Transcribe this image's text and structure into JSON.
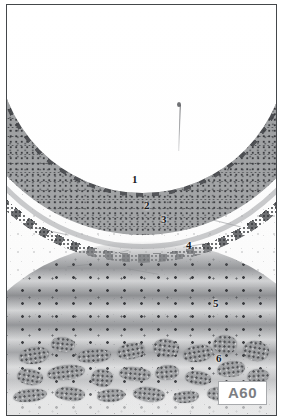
{
  "plate": {
    "id_label": "A60",
    "image_kind": "histological-micrograph",
    "frame_border_color": "#44474a",
    "id_box_border_color": "#a8aaad",
    "id_box_text_color": "#7c7e82"
  },
  "labels": [
    {
      "text": "1",
      "x": 131,
      "y": 179,
      "target": "mucosa"
    },
    {
      "text": "2",
      "x": 143,
      "y": 205,
      "target": "muscularis-mucosae"
    },
    {
      "text": "3",
      "x": 160,
      "y": 219,
      "target": "submucosal-gland-layer"
    },
    {
      "text": "4",
      "x": 185,
      "y": 245,
      "target": "submucosa"
    },
    {
      "text": "5",
      "x": 212,
      "y": 303,
      "target": "muscularis-externa"
    },
    {
      "text": "6",
      "x": 215,
      "y": 358,
      "target": "subserosal-glands"
    }
  ],
  "tissue_layers": [
    {
      "name": "lumen",
      "tone": "#ffffff"
    },
    {
      "name": "mucosa",
      "tone": "#9a9c9e"
    },
    {
      "name": "muscularis-mucosae",
      "tone": "#969a9b"
    },
    {
      "name": "submucosal-gland-layer",
      "tone": "#585a5d"
    },
    {
      "name": "submucosa",
      "tone": "#fbfbfb"
    },
    {
      "name": "muscularis-externa",
      "tone": "#767a7c"
    },
    {
      "name": "subserosal-glands",
      "tone": "#8e9093"
    }
  ],
  "gland_clumps": [
    {
      "x": 12,
      "y": 16,
      "w": 30,
      "h": 17,
      "r": -8
    },
    {
      "x": 44,
      "y": 6,
      "w": 24,
      "h": 15,
      "r": 6
    },
    {
      "x": 70,
      "y": 18,
      "w": 34,
      "h": 14,
      "r": -4
    },
    {
      "x": 10,
      "y": 38,
      "w": 26,
      "h": 16,
      "r": 10
    },
    {
      "x": 40,
      "y": 34,
      "w": 38,
      "h": 15,
      "r": -6
    },
    {
      "x": 84,
      "y": 38,
      "w": 22,
      "h": 18,
      "r": 4
    },
    {
      "x": 110,
      "y": 12,
      "w": 28,
      "h": 16,
      "r": -10
    },
    {
      "x": 112,
      "y": 36,
      "w": 32,
      "h": 14,
      "r": 5
    },
    {
      "x": 146,
      "y": 8,
      "w": 26,
      "h": 18,
      "r": 7
    },
    {
      "x": 148,
      "y": 34,
      "w": 24,
      "h": 15,
      "r": -5
    },
    {
      "x": 176,
      "y": 14,
      "w": 30,
      "h": 17,
      "r": -9
    },
    {
      "x": 178,
      "y": 40,
      "w": 26,
      "h": 14,
      "r": 8
    },
    {
      "x": 206,
      "y": 4,
      "w": 24,
      "h": 19,
      "r": 3
    },
    {
      "x": 210,
      "y": 30,
      "w": 28,
      "h": 16,
      "r": -7
    },
    {
      "x": 236,
      "y": 10,
      "w": 26,
      "h": 20,
      "r": 9
    },
    {
      "x": 240,
      "y": 38,
      "w": 22,
      "h": 14,
      "r": -3
    },
    {
      "x": 6,
      "y": 58,
      "w": 34,
      "h": 13,
      "r": -6
    },
    {
      "x": 48,
      "y": 56,
      "w": 30,
      "h": 14,
      "r": 5
    },
    {
      "x": 90,
      "y": 58,
      "w": 28,
      "h": 13,
      "r": -4
    },
    {
      "x": 126,
      "y": 56,
      "w": 32,
      "h": 15,
      "r": 6
    },
    {
      "x": 166,
      "y": 60,
      "w": 26,
      "h": 12,
      "r": -5
    },
    {
      "x": 200,
      "y": 56,
      "w": 24,
      "h": 14,
      "r": 4
    }
  ],
  "wisps": [
    {
      "x": 28,
      "y": 30,
      "w": 34,
      "r": 12
    },
    {
      "x": 96,
      "y": 52,
      "w": 26,
      "r": -14
    },
    {
      "x": 150,
      "y": 18,
      "w": 30,
      "r": 8
    },
    {
      "x": 176,
      "y": 44,
      "w": 22,
      "r": -10
    },
    {
      "x": 206,
      "y": 22,
      "w": 28,
      "r": 14
    },
    {
      "x": 60,
      "y": 64,
      "w": 24,
      "r": -6
    },
    {
      "x": 120,
      "y": 70,
      "w": 32,
      "r": 10
    }
  ]
}
